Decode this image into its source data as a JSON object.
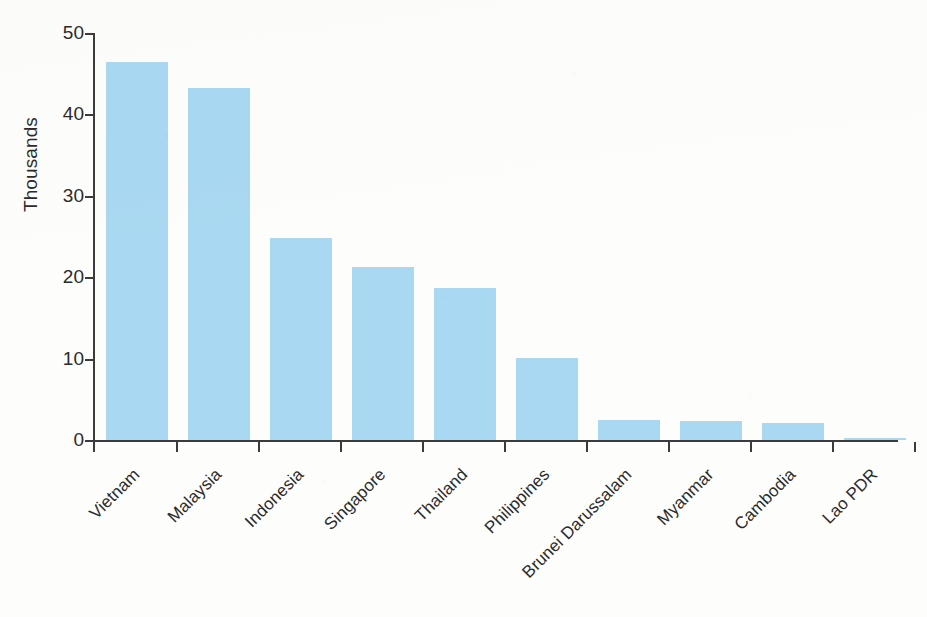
{
  "chart_data": {
    "type": "bar",
    "title": "",
    "xlabel": "",
    "ylabel": "Thousands",
    "categories": [
      "Vietnam",
      "Malaysia",
      "Indonesia",
      "Singapore",
      "Thailand",
      "Philippines",
      "Brunei Darussalam",
      "Myanmar",
      "Cambodia",
      "Lao PDR"
    ],
    "values": [
      46.5,
      43.2,
      24.8,
      21.2,
      18.7,
      10.1,
      2.5,
      2.3,
      2.1,
      0.3
    ],
    "ylim": [
      0,
      50
    ],
    "ytick_labels": [
      "0",
      "10",
      "20",
      "30",
      "40",
      "50"
    ],
    "ytick_values": [
      0,
      10,
      20,
      30,
      40,
      50
    ],
    "grid": false,
    "legend": false,
    "bar_color": "#a9d8f2",
    "axis_color": "#3b3b3b",
    "background_color": "#fdfdfc",
    "xlabel_rotation_degrees": -45
  }
}
